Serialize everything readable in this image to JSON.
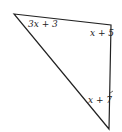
{
  "diagram": {
    "type": "triangle",
    "stroke_color": "#222222",
    "vertices": {
      "top_left": [
        14,
        14
      ],
      "top_right": [
        111,
        25
      ],
      "bottom": [
        109,
        129
      ]
    },
    "angle_labels": {
      "top_left": "3x + 3",
      "top_right": "x + 5",
      "bottom": "x + 7"
    }
  }
}
